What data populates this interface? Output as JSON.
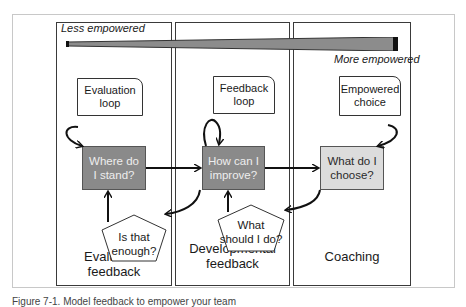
{
  "scale": {
    "less_label": "Less empowered",
    "more_label": "More empowered"
  },
  "columns": [
    {
      "title": "Evaluative feedback",
      "note": [
        "Evaluation",
        "loop"
      ],
      "question": [
        "Where do",
        "I stand?"
      ],
      "pentagon": [
        "Is that",
        "enough?"
      ],
      "box_style": "dark",
      "box_color": "#8a8a8a"
    },
    {
      "title": [
        "Developmental",
        "feedback"
      ],
      "note": [
        "Feedback",
        "loop"
      ],
      "question": [
        "How can I",
        "improve?"
      ],
      "pentagon": [
        "What",
        "should I do?"
      ],
      "box_style": "dark",
      "box_color": "#8a8a8a"
    },
    {
      "title": "Coaching",
      "note": [
        "Empowered",
        "choice"
      ],
      "question": [
        "What do I",
        "choose?"
      ],
      "box_style": "light",
      "box_color": "#dcdcdc"
    }
  ],
  "caption": "Figure 7-1. Model feedback to empower your team"
}
